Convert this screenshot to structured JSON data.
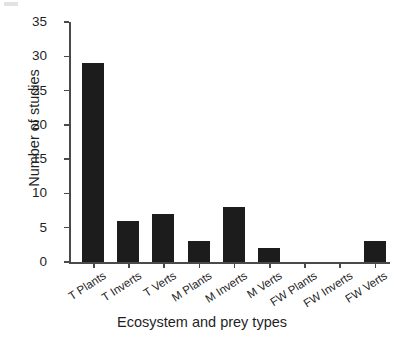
{
  "chart_data": {
    "type": "bar",
    "title": "",
    "xlabel": "Ecosystem and prey types",
    "ylabel": "Number of studies",
    "categories": [
      "T Plants",
      "T Inverts",
      "T Verts",
      "M Plants",
      "M Inverts",
      "M Verts",
      "FW Plants",
      "FW Inverts",
      "FW Verts"
    ],
    "values": [
      29,
      6,
      7,
      3,
      8,
      2,
      0,
      0,
      3
    ],
    "ylim": [
      0,
      35
    ],
    "yticks": [
      0,
      5,
      10,
      15,
      20,
      25,
      30,
      35
    ],
    "ytick_labels": [
      "0",
      "5",
      "10",
      "15",
      "20",
      "25",
      "30",
      "35"
    ],
    "grid": false,
    "legend": false,
    "bar_color": "#1c1c1c",
    "axis_color": "#4a4a4a",
    "background": "#ffffff"
  }
}
